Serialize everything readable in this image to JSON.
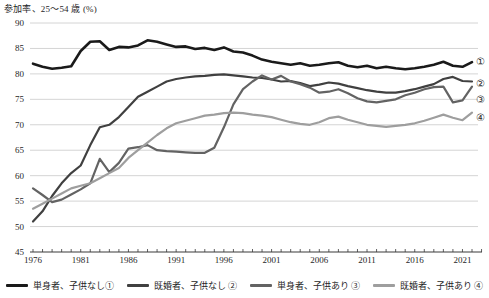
{
  "chart_data": {
    "type": "line",
    "title": "参加率、25～54 歳 (%)",
    "xlabel": "",
    "ylabel": "参加率 (%)",
    "ylim": [
      45,
      90
    ],
    "y_ticks": [
      45,
      50,
      55,
      60,
      65,
      70,
      75,
      80,
      85,
      90
    ],
    "x": [
      1976,
      1977,
      1978,
      1979,
      1980,
      1981,
      1982,
      1983,
      1984,
      1985,
      1986,
      1987,
      1988,
      1989,
      1990,
      1991,
      1992,
      1993,
      1994,
      1995,
      1996,
      1997,
      1998,
      1999,
      2000,
      2001,
      2002,
      2003,
      2004,
      2005,
      2006,
      2007,
      2008,
      2009,
      2010,
      2011,
      2012,
      2013,
      2014,
      2015,
      2016,
      2017,
      2018,
      2019,
      2020,
      2021,
      2022
    ],
    "x_tick_labels": [
      "1976",
      "1981",
      "1986",
      "1991",
      "1996",
      "2001",
      "2006",
      "2011",
      "2016",
      "2021"
    ],
    "grid": "horizontal",
    "legend_position": "bottom",
    "series": [
      {
        "name": "single-no-children",
        "legend_label": "単身者、子供なし①",
        "end_label": "①",
        "color": "#1a1a1a",
        "width": 2.6,
        "values": [
          82.0,
          81.4,
          81.0,
          81.2,
          81.5,
          84.5,
          86.3,
          86.4,
          84.7,
          85.3,
          85.2,
          85.6,
          86.6,
          86.3,
          85.8,
          85.3,
          85.4,
          84.9,
          85.1,
          84.7,
          85.2,
          84.4,
          84.2,
          83.6,
          82.8,
          82.4,
          82.1,
          81.8,
          82.1,
          81.6,
          81.8,
          82.1,
          82.3,
          81.6,
          81.3,
          81.6,
          81.1,
          81.4,
          81.1,
          80.9,
          81.1,
          81.4,
          81.8,
          82.4,
          81.6,
          81.4,
          82.3
        ]
      },
      {
        "name": "married-no-children",
        "legend_label": "既婚者、子供なし ②",
        "end_label": "②",
        "color": "#404040",
        "width": 2.2,
        "values": [
          51.0,
          53.0,
          56.0,
          58.5,
          60.5,
          62.0,
          66.0,
          69.5,
          70.0,
          71.5,
          73.5,
          75.5,
          76.5,
          77.5,
          78.5,
          79.0,
          79.3,
          79.5,
          79.6,
          79.8,
          79.9,
          79.7,
          79.5,
          79.3,
          79.2,
          78.9,
          78.5,
          78.6,
          78.2,
          77.6,
          77.9,
          78.3,
          78.1,
          77.6,
          77.2,
          76.8,
          76.5,
          76.3,
          76.3,
          76.6,
          77.0,
          77.5,
          78.0,
          79.0,
          79.4,
          78.6,
          78.5
        ]
      },
      {
        "name": "single-with-children",
        "legend_label": "単身者、子供あり ③",
        "end_label": "③",
        "color": "#636363",
        "width": 2.2,
        "values": [
          57.5,
          56.2,
          54.8,
          55.3,
          56.3,
          57.3,
          58.5,
          63.3,
          60.7,
          62.5,
          65.3,
          65.6,
          66.0,
          65.0,
          64.8,
          64.7,
          64.6,
          64.5,
          64.5,
          65.5,
          69.5,
          74.0,
          77.0,
          78.5,
          79.7,
          78.9,
          79.6,
          78.5,
          78.0,
          77.3,
          76.3,
          76.5,
          77.0,
          76.2,
          75.2,
          74.6,
          74.4,
          74.7,
          75.0,
          75.8,
          76.3,
          77.0,
          77.4,
          77.5,
          74.4,
          74.8,
          77.5
        ]
      },
      {
        "name": "married-with-children",
        "legend_label": "既婚者、子供あり ④",
        "end_label": "④",
        "color": "#9e9e9e",
        "width": 2.2,
        "values": [
          53.5,
          54.5,
          55.5,
          56.5,
          57.5,
          58.0,
          58.5,
          59.5,
          60.5,
          61.5,
          63.5,
          65.0,
          66.5,
          68.0,
          69.3,
          70.3,
          70.8,
          71.3,
          71.8,
          72.0,
          72.3,
          72.4,
          72.3,
          72.0,
          71.8,
          71.5,
          71.0,
          70.5,
          70.2,
          70.0,
          70.5,
          71.3,
          71.6,
          71.0,
          70.5,
          70.0,
          69.8,
          69.6,
          69.8,
          70.0,
          70.3,
          70.8,
          71.4,
          72.0,
          71.4,
          70.9,
          72.4
        ]
      }
    ]
  }
}
